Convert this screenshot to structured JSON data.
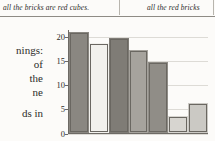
{
  "page": {
    "background_color": "#fcfbf9",
    "header": {
      "left_fragment": "all the bricks are red cubes.",
      "right_fragment": "all the red bricks",
      "rule_color": "#8e8b85"
    },
    "body_column_lines": [
      "nings:",
      "of",
      "the",
      "ne",
      "ds in"
    ]
  },
  "chart_data": {
    "type": "bar",
    "title": "",
    "xlabel": "",
    "ylabel": "",
    "ylim": [
      0,
      21.5
    ],
    "yticks": [
      0,
      5,
      10,
      15,
      20
    ],
    "ytick_labels": [
      "0",
      "5",
      "10",
      "15",
      "20"
    ],
    "grid": true,
    "legend": "none",
    "categories": [
      "1",
      "2",
      "3",
      "4",
      "5",
      "6",
      "7"
    ],
    "values": [
      21.0,
      18.7,
      19.8,
      17.3,
      14.9,
      3.5,
      6.3
    ],
    "bar_colors": [
      "#8a8781",
      "#f2f1ed",
      "#7f7c76",
      "#a6a39d",
      "#908d87",
      "#d7d5d0",
      "#cbc9c4"
    ],
    "bar_edge_color": "#6a6761",
    "axis_color": "#6d6a65",
    "gridline_color": "#dddbd6"
  }
}
